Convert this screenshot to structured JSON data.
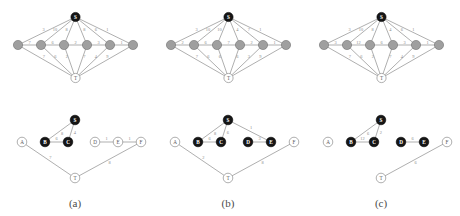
{
  "figure": {
    "panel_count": 3,
    "captions": [
      "(a)",
      "(b)",
      "(c)"
    ],
    "node_names": {
      "S": "S",
      "T": "T",
      "A": "A",
      "B": "B",
      "C": "C",
      "D": "D",
      "E": "E",
      "F": "F"
    },
    "colors": {
      "dark_node": "#161616",
      "gray_node": "#9f9f9f",
      "white_node": "#ffffff",
      "edge": "#8c8c8c",
      "weight_text": "#8a8a8a",
      "caption_text": "#4a4a4a"
    }
  },
  "chart_data": {
    "type": "diagram",
    "title": "",
    "panels": [
      {
        "caption": "(a)",
        "top_graph": {
          "description": "complete-ish source-sink graph",
          "nodes": [
            {
              "id": "S",
              "label": "S",
              "style": "dark"
            },
            {
              "id": "A",
              "label": "",
              "style": "gray"
            },
            {
              "id": "B",
              "label": "",
              "style": "gray"
            },
            {
              "id": "C",
              "label": "",
              "style": "gray"
            },
            {
              "id": "D",
              "label": "",
              "style": "gray"
            },
            {
              "id": "E",
              "label": "",
              "style": "gray"
            },
            {
              "id": "F",
              "label": "",
              "style": "gray"
            },
            {
              "id": "T",
              "label": "T",
              "style": "white"
            }
          ],
          "s_edges": [
            {
              "to": "A",
              "weight": "3"
            },
            {
              "to": "B",
              "weight": "10"
            },
            {
              "to": "C",
              "weight": "8"
            },
            {
              "to": "D",
              "weight": "8"
            },
            {
              "to": "E",
              "weight": "6"
            },
            {
              "to": "F",
              "weight": "1"
            }
          ],
          "chain_edges": [
            {
              "from": "A",
              "to": "B",
              "weight": "7"
            },
            {
              "from": "B",
              "to": "C",
              "weight": "6"
            },
            {
              "from": "C",
              "to": "D",
              "weight": "2"
            },
            {
              "from": "D",
              "to": "E",
              "weight": "3"
            },
            {
              "from": "E",
              "to": "F",
              "weight": "1"
            }
          ],
          "t_edges": [
            {
              "from": "A",
              "weight": "7"
            },
            {
              "from": "B",
              "weight": "6"
            },
            {
              "from": "C",
              "weight": "2"
            },
            {
              "from": "D",
              "weight": "7"
            },
            {
              "from": "E",
              "weight": "4"
            },
            {
              "from": "F",
              "weight": "9"
            }
          ]
        },
        "bottom_graph": {
          "nodes": [
            {
              "id": "S",
              "label": "S",
              "style": "dark"
            },
            {
              "id": "A",
              "label": "A",
              "style": "white"
            },
            {
              "id": "B",
              "label": "B",
              "style": "dark"
            },
            {
              "id": "C",
              "label": "C",
              "style": "dark"
            },
            {
              "id": "D",
              "label": "D",
              "style": "white"
            },
            {
              "id": "E",
              "label": "E",
              "style": "white"
            },
            {
              "id": "F",
              "label": "F",
              "style": "white"
            },
            {
              "id": "T",
              "label": "T",
              "style": "white"
            }
          ],
          "edges": [
            {
              "from": "S",
              "to": "B",
              "weight": "8"
            },
            {
              "from": "S",
              "to": "C",
              "weight": "4"
            },
            {
              "from": "B",
              "to": "C",
              "weight": "6"
            },
            {
              "from": "D",
              "to": "E",
              "weight": "1"
            },
            {
              "from": "E",
              "to": "F",
              "weight": "1"
            },
            {
              "from": "A",
              "to": "T",
              "weight": "7"
            },
            {
              "from": "F",
              "to": "T",
              "weight": "8"
            }
          ]
        }
      },
      {
        "caption": "(b)",
        "top_graph": {
          "description": "complete-ish source-sink graph",
          "nodes": [
            {
              "id": "S",
              "label": "S",
              "style": "dark"
            },
            {
              "id": "A",
              "label": "",
              "style": "gray"
            },
            {
              "id": "B",
              "label": "",
              "style": "gray"
            },
            {
              "id": "C",
              "label": "",
              "style": "gray"
            },
            {
              "id": "D",
              "label": "",
              "style": "gray"
            },
            {
              "id": "E",
              "label": "",
              "style": "gray"
            },
            {
              "id": "F",
              "label": "",
              "style": "gray"
            },
            {
              "id": "T",
              "label": "T",
              "style": "white"
            }
          ],
          "s_edges": [
            {
              "to": "A",
              "weight": "3"
            },
            {
              "to": "B",
              "weight": "10"
            },
            {
              "to": "C",
              "weight": "10"
            },
            {
              "to": "D",
              "weight": "4"
            },
            {
              "to": "E",
              "weight": "7"
            },
            {
              "to": "F",
              "weight": "1"
            }
          ],
          "chain_edges": [
            {
              "from": "A",
              "to": "B",
              "weight": "2"
            },
            {
              "from": "B",
              "to": "C",
              "weight": "6"
            },
            {
              "from": "C",
              "to": "D",
              "weight": "7"
            },
            {
              "from": "D",
              "to": "E",
              "weight": "2"
            },
            {
              "from": "E",
              "to": "F",
              "weight": "1"
            }
          ],
          "t_edges": [
            {
              "from": "A",
              "weight": "7"
            },
            {
              "from": "B",
              "weight": "6"
            },
            {
              "from": "C",
              "weight": "6"
            },
            {
              "from": "D",
              "weight": "6"
            },
            {
              "from": "E",
              "weight": "3"
            },
            {
              "from": "F",
              "weight": "9"
            }
          ]
        },
        "bottom_graph": {
          "nodes": [
            {
              "id": "S",
              "label": "S",
              "style": "dark"
            },
            {
              "id": "A",
              "label": "A",
              "style": "white"
            },
            {
              "id": "B",
              "label": "B",
              "style": "dark"
            },
            {
              "id": "C",
              "label": "C",
              "style": "dark"
            },
            {
              "id": "D",
              "label": "D",
              "style": "dark"
            },
            {
              "id": "E",
              "label": "E",
              "style": "dark"
            },
            {
              "id": "F",
              "label": "F",
              "style": "white"
            },
            {
              "id": "T",
              "label": "T",
              "style": "white"
            }
          ],
          "edges": [
            {
              "from": "S",
              "to": "B",
              "weight": "8"
            },
            {
              "from": "S",
              "to": "C",
              "weight": "6"
            },
            {
              "from": "S",
              "to": "E",
              "weight": "1"
            },
            {
              "from": "B",
              "to": "C",
              "weight": "6"
            },
            {
              "from": "D",
              "to": "E",
              "weight": "3"
            },
            {
              "from": "A",
              "to": "T",
              "weight": "2"
            },
            {
              "from": "F",
              "to": "T",
              "weight": "8"
            }
          ]
        }
      },
      {
        "caption": "(c)",
        "top_graph": {
          "description": "complete-ish source-sink graph",
          "nodes": [
            {
              "id": "S",
              "label": "S",
              "style": "dark"
            },
            {
              "id": "A",
              "label": "",
              "style": "gray"
            },
            {
              "id": "B",
              "label": "",
              "style": "gray"
            },
            {
              "id": "C",
              "label": "",
              "style": "gray"
            },
            {
              "id": "D",
              "label": "",
              "style": "gray"
            },
            {
              "id": "E",
              "label": "",
              "style": "gray"
            },
            {
              "id": "F",
              "label": "",
              "style": "gray"
            },
            {
              "id": "T",
              "label": "T",
              "style": "white"
            }
          ],
          "s_edges": [
            {
              "to": "A",
              "weight": "3"
            },
            {
              "to": "B",
              "weight": "10"
            },
            {
              "to": "C",
              "weight": "8"
            },
            {
              "to": "D",
              "weight": "4"
            },
            {
              "to": "E",
              "weight": "6"
            },
            {
              "to": "F",
              "weight": "1"
            }
          ],
          "chain_edges": [
            {
              "from": "A",
              "to": "B",
              "weight": "3"
            },
            {
              "from": "B",
              "to": "C",
              "weight": "12"
            },
            {
              "from": "C",
              "to": "D",
              "weight": "6"
            },
            {
              "from": "D",
              "to": "E",
              "weight": "3"
            },
            {
              "from": "E",
              "to": "F",
              "weight": "1"
            }
          ],
          "t_edges": [
            {
              "from": "A",
              "weight": "7"
            },
            {
              "from": "B",
              "weight": "6"
            },
            {
              "from": "C",
              "weight": "2"
            },
            {
              "from": "D",
              "weight": "7"
            },
            {
              "from": "E",
              "weight": "4"
            },
            {
              "from": "F",
              "weight": "9"
            }
          ]
        },
        "bottom_graph": {
          "nodes": [
            {
              "id": "S",
              "label": "S",
              "style": "dark"
            },
            {
              "id": "A",
              "label": "A",
              "style": "white"
            },
            {
              "id": "B",
              "label": "B",
              "style": "dark"
            },
            {
              "id": "C",
              "label": "C",
              "style": "dark"
            },
            {
              "id": "D",
              "label": "D",
              "style": "dark"
            },
            {
              "id": "E",
              "label": "E",
              "style": "dark"
            },
            {
              "id": "F",
              "label": "F",
              "style": "white"
            },
            {
              "id": "T",
              "label": "T",
              "style": "white"
            }
          ],
          "edges": [
            {
              "from": "S",
              "to": "B",
              "weight": "6"
            },
            {
              "from": "S",
              "to": "C",
              "weight": "2"
            },
            {
              "from": "B",
              "to": "C",
              "weight": "12"
            },
            {
              "from": "D",
              "to": "E",
              "weight": "6"
            },
            {
              "from": "F",
              "to": "T",
              "weight": "6"
            }
          ]
        }
      }
    ]
  }
}
